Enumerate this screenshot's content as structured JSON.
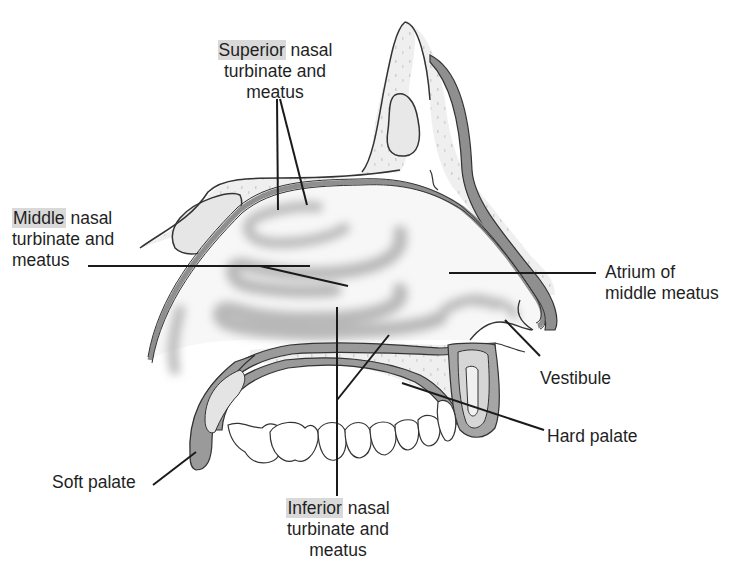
{
  "diagram": {
    "colors": {
      "highlight": "#d9d9d9",
      "mucosa": "#9a9a9a",
      "bone_fill": "#eeeeee",
      "outline": "#2a2a2a",
      "turbinate_shadow": "#bdbdbd"
    },
    "labels": {
      "superior": {
        "highlight": "Superior",
        "rest1": " nasal",
        "line2": "turbinate and",
        "line3": "meatus"
      },
      "middle": {
        "highlight": "Middle",
        "rest1": " nasal",
        "line2": "turbinate and",
        "line3": "meatus"
      },
      "inferior": {
        "highlight": "Inferior",
        "rest1": " nasal",
        "line2": "turbinate and",
        "line3": "meatus"
      },
      "atrium": {
        "line1": "Atrium of",
        "line2": "middle meatus"
      },
      "vestibule": "Vestibule",
      "hard_palate": "Hard palate",
      "soft_palate": "Soft palate"
    }
  }
}
